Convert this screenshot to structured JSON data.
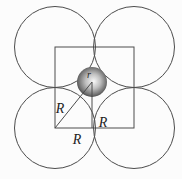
{
  "figure": {
    "labels": {
      "hypotenuse_radius": "R",
      "vertical_radius": "R",
      "horizontal_radius": "R",
      "void_sphere_radius": "r"
    },
    "colors": {
      "background": "#fcfcfc",
      "line": "#4c4c4c",
      "label": "#1e1e1e",
      "sphere_stops": [
        "#f8f8f8",
        "#bfbfbf",
        "#6e6e6e",
        "#1f1f1f"
      ]
    }
  }
}
